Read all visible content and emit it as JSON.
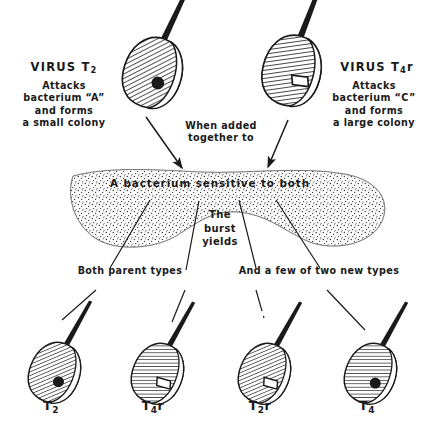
{
  "figure": {
    "ink_color": "#1a1a1a",
    "background_color": "#ffffff"
  },
  "top_left_virus": {
    "heading": "VIRUS T",
    "heading_sub": "2",
    "description": "Attacks\nbacterium “A”\nand forms\na small colony",
    "hatch": "diagonal",
    "marker": "filled-dot"
  },
  "top_right_virus": {
    "heading": "VIRUS T",
    "heading_sub": "4",
    "heading_suffix": "r",
    "description": "Attacks\nbacterium “C”\nand forms\na large colony",
    "hatch": "horizontal",
    "marker": "open-parallelogram"
  },
  "middle": {
    "when_added": "When added\ntogether to",
    "blob_label": "A bacterium sensitive to both",
    "burst_yields": "The\nburst\nyields",
    "both_parent_types": "Both parent types",
    "new_types": "And a few of two new types"
  },
  "progeny": [
    {
      "name": "T",
      "sub": "2",
      "suffix": "",
      "hatch": "diagonal",
      "marker": "filled-dot"
    },
    {
      "name": "T",
      "sub": "4",
      "suffix": "r",
      "hatch": "horizontal",
      "marker": "open-parallelogram"
    },
    {
      "name": "T",
      "sub": "2",
      "suffix": "r",
      "hatch": "diagonal",
      "marker": "open-parallelogram"
    },
    {
      "name": "T",
      "sub": "4",
      "suffix": "",
      "hatch": "horizontal",
      "marker": "filled-dot"
    }
  ]
}
